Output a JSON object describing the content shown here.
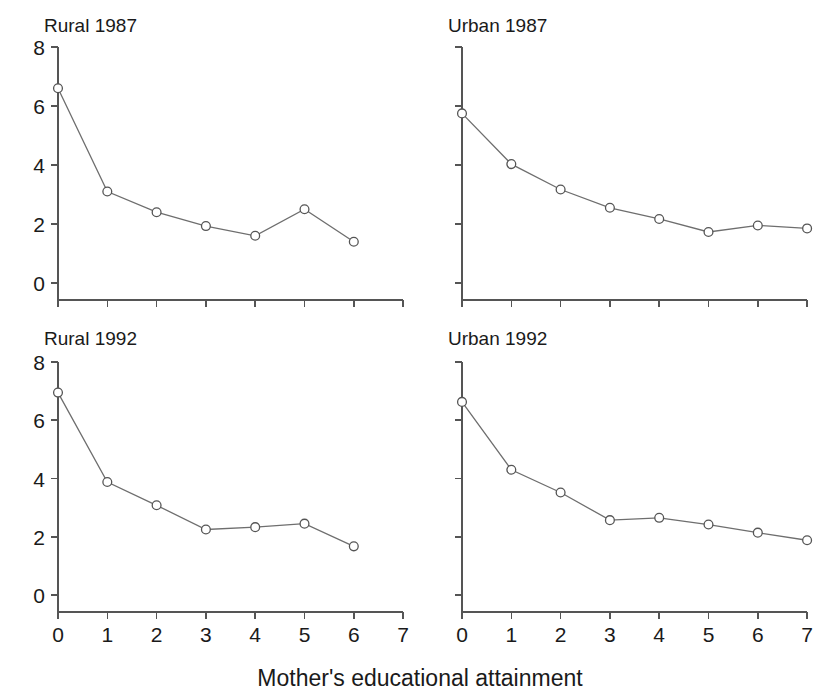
{
  "chart_data": {
    "type": "line",
    "title": "",
    "xlabel": "Mother's educational attainment",
    "ylabel": "",
    "xlim": [
      0,
      7
    ],
    "ylim": [
      0,
      8
    ],
    "xticks": [
      0,
      1,
      2,
      3,
      4,
      5,
      6,
      7
    ],
    "yticks": [
      0,
      2,
      4,
      6,
      8
    ],
    "grid": false,
    "legend": "none",
    "marker": "open-circle",
    "line_color": "#6e6e6e",
    "marker_color": "#555555",
    "marker_fill": "#ffffff",
    "panel_layout": "2x2",
    "panels": [
      {
        "name": "rural-1987",
        "title": "Rural 1987",
        "row": 0,
        "col": 0,
        "show_ytick_labels": true,
        "show_xtick_labels": false,
        "x": [
          0,
          1,
          2,
          3,
          4,
          5,
          6
        ],
        "values": [
          6.6,
          3.1,
          2.4,
          1.93,
          1.6,
          2.5,
          1.4
        ]
      },
      {
        "name": "urban-1987",
        "title": "Urban 1987",
        "row": 0,
        "col": 1,
        "show_ytick_labels": false,
        "show_xtick_labels": false,
        "x": [
          0,
          1,
          2,
          3,
          4,
          5,
          6,
          7
        ],
        "values": [
          5.75,
          4.03,
          3.17,
          2.55,
          2.17,
          1.73,
          1.95,
          1.85
        ]
      },
      {
        "name": "rural-1992",
        "title": "Rural 1992",
        "row": 1,
        "col": 0,
        "show_ytick_labels": true,
        "show_xtick_labels": true,
        "x": [
          0,
          1,
          2,
          3,
          4,
          5,
          6
        ],
        "values": [
          6.95,
          3.88,
          3.08,
          2.25,
          2.33,
          2.45,
          1.67
        ]
      },
      {
        "name": "urban-1992",
        "title": "Urban 1992",
        "row": 1,
        "col": 1,
        "show_ytick_labels": false,
        "show_xtick_labels": true,
        "x": [
          0,
          1,
          2,
          3,
          4,
          5,
          6,
          7
        ],
        "values": [
          6.63,
          4.3,
          3.52,
          2.57,
          2.65,
          2.42,
          2.14,
          1.88
        ]
      }
    ]
  }
}
